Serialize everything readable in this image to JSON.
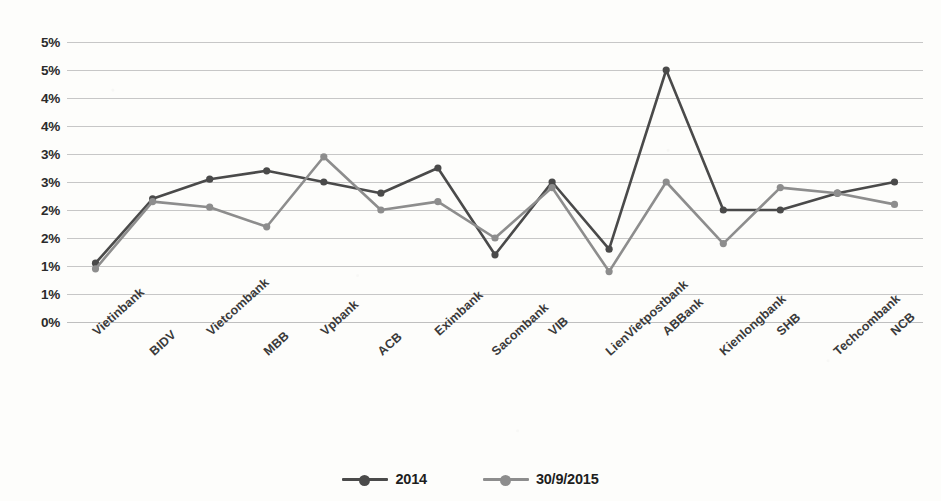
{
  "chart_data": {
    "type": "line",
    "title": "",
    "xlabel": "",
    "ylabel": "",
    "grid": true,
    "legend_position": "bottom",
    "categories": [
      "Vietinbank",
      "BIDV",
      "Vietcombank",
      "MBB",
      "Vpbank",
      "ACB",
      "Eximbank",
      "Sacombank",
      "VIB",
      "LienVietpostbank",
      "ABBank",
      "Kienlongbank",
      "SHB",
      "Techcombank",
      "NCB"
    ],
    "ylim": [
      0,
      5
    ],
    "ytick_values": [
      5,
      4.5,
      4,
      3.5,
      3,
      2.5,
      2,
      1.5,
      1,
      0.5,
      0
    ],
    "ytick_labels": [
      "5%",
      "5%",
      "4%",
      "4%",
      "3%",
      "3%",
      "2%",
      "2%",
      "1%",
      "1%",
      "0%"
    ],
    "series": [
      {
        "name": "2014",
        "color": "#4a4a4a",
        "values": [
          1.05,
          2.2,
          2.55,
          2.7,
          2.5,
          2.3,
          2.75,
          1.2,
          2.5,
          1.3,
          4.5,
          2.0,
          2.0,
          2.3,
          2.5
        ]
      },
      {
        "name": "30/9/2015",
        "color": "#8d8d8d",
        "values": [
          0.95,
          2.15,
          2.05,
          1.7,
          2.95,
          2.0,
          2.15,
          1.5,
          2.4,
          0.9,
          2.5,
          1.4,
          2.4,
          2.3,
          2.1
        ]
      }
    ]
  },
  "legend": {
    "items": [
      {
        "label": "2014",
        "color": "#4a4a4a"
      },
      {
        "label": "30/9/2015",
        "color": "#8d8d8d"
      }
    ]
  },
  "colors": {
    "series_2014": "#4a4a4a",
    "series_2015": "#8d8d8d",
    "gridline": "#bdbdbd",
    "text": "#2b2b2b",
    "background": "#fdfdfb"
  }
}
